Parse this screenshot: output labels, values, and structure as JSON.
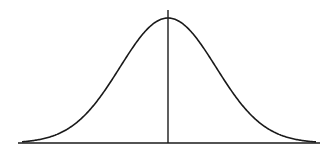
{
  "diagram": {
    "type": "normal-distribution-curve",
    "stroke_color": "#1a1a1a",
    "background": "#ffffff",
    "baseline": {
      "x1": 18,
      "x2": 320,
      "y": 143
    },
    "mean_line": {
      "x": 168,
      "y1": 10,
      "y2": 143
    },
    "curve": {
      "center_x": 168,
      "peak_y": 18,
      "base_y": 143,
      "sigma_px": 48,
      "x_start": 22,
      "x_end": 316
    }
  }
}
